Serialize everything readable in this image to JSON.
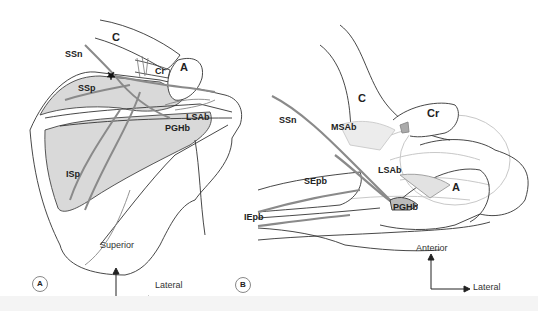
{
  "figure": {
    "panels": [
      {
        "id": "A",
        "badge": "A",
        "labels": {
          "C": "C",
          "SSn": "SSn",
          "A": "A",
          "Cr": "Cr",
          "SSp": "SSp",
          "LSAb": "LSAb",
          "PGHb": "PGHb",
          "ISp": "ISp"
        },
        "orientation": {
          "vertical": "Superior",
          "horizontal": "Lateral"
        }
      },
      {
        "id": "B",
        "badge": "B",
        "labels": {
          "C": "C",
          "Cr": "Cr",
          "SSn": "SSn",
          "MSAb": "MSAb",
          "LSAb": "LSAb",
          "SEpb": "SEpb",
          "A": "A",
          "PGHb": "PGHb",
          "IEpb": "IEpb"
        },
        "orientation": {
          "vertical": "Anterior",
          "horizontal": "Lateral"
        }
      }
    ],
    "colors": {
      "outline": "#333333",
      "muscle_fill": "#d9d9d9",
      "nerve": "#8a8a8a",
      "faint_vessels": "#c8c8c8",
      "footer": "#f4f4f4"
    }
  }
}
